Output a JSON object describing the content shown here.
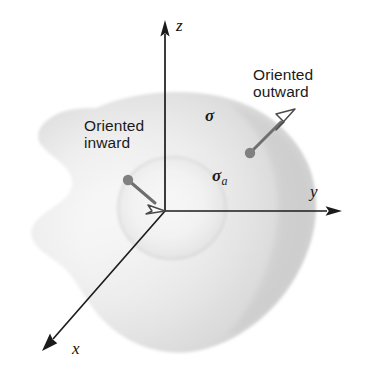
{
  "figure": {
    "kind": "oriented-surface-diagram",
    "width": 368,
    "height": 375,
    "background_color": "#ffffff"
  },
  "axes": {
    "origin": {
      "x": 165,
      "y": 211
    },
    "items": [
      {
        "id": "z",
        "label": "z",
        "label_x": 176,
        "label_y": 16,
        "arrow": "solid"
      },
      {
        "id": "y",
        "label": "y",
        "label_x": 310,
        "label_y": 182,
        "arrow": "solid"
      },
      {
        "id": "x",
        "label": "x",
        "label_y": 339,
        "label_x": 72,
        "arrow": "solid"
      }
    ],
    "line_color": "#1b1b1b"
  },
  "surface": {
    "label": "σ",
    "label_x": 205,
    "label_y": 106,
    "fill_light": "#fdfdfd",
    "fill_mid": "#e3e3e3",
    "fill_dark": "#c9c9c9"
  },
  "hole": {
    "label": "σ",
    "subscript": "a",
    "label_x": 212,
    "label_y": 166,
    "center_x": 172,
    "center_y": 208,
    "radius_x": 54,
    "radius_y": 51
  },
  "normals": [
    {
      "id": "outward",
      "text_line1": "Oriented",
      "text_line2": "outward",
      "text_x": 253,
      "text_y": 66,
      "dot_x": 250,
      "dot_y": 153,
      "tip_x": 288,
      "tip_y": 115,
      "dot_color": "#808080",
      "shaft_color": "#6e6e6e",
      "head_fill": "#ffffff",
      "head_stroke": "#4a4a4a"
    },
    {
      "id": "inward",
      "text_line1": "Oriented",
      "text_line2": "inward",
      "text_x": 84,
      "text_y": 117,
      "dot_x": 128,
      "dot_y": 180,
      "tip_x": 160,
      "tip_y": 208,
      "dot_color": "#808080",
      "shaft_color": "#6e6e6e",
      "head_fill": "#ffffff",
      "head_stroke": "#4a4a4a"
    }
  ]
}
